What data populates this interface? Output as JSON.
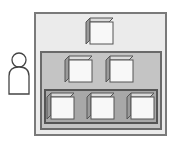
{
  "diagram": {
    "type": "nested-tiers",
    "actor": {
      "icon": "person-icon"
    },
    "tiers": [
      {
        "name": "outer",
        "fill": "#ebebeb",
        "border": "#7a7a7a",
        "cube_count": 1
      },
      {
        "name": "middle",
        "fill": "#c4c4c4",
        "border": "#6a6a6a",
        "cube_count": 2
      },
      {
        "name": "inner",
        "fill": "#a8a8a8",
        "border": "#555555",
        "cube_count": 3
      }
    ],
    "cube": {
      "icon": "cube-icon",
      "face": "#f8f8f8",
      "side": "#9a9a9a",
      "top": "#dcdcdc",
      "stroke": "#555555"
    }
  }
}
